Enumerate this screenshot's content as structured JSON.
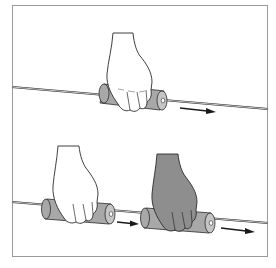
{
  "figure": {
    "panels": [
      {
        "id": "top",
        "description": "Hand gripping foam tube on wire, sliding right",
        "arrow": "right"
      },
      {
        "id": "bottom",
        "description": "Hand moves tube along wire; second position shaded",
        "arrows": [
          "right",
          "right"
        ]
      }
    ],
    "colors": {
      "border": "#9a9a9a",
      "wire": "#8a8a8a",
      "tube": "#a8a8a8",
      "tube_end": "#c4c4c4",
      "hand_light": "#ffffff",
      "hand_dark": "#8e8e8e",
      "outline": "#2a2a2a",
      "arrow": "#1a1a1a"
    }
  }
}
